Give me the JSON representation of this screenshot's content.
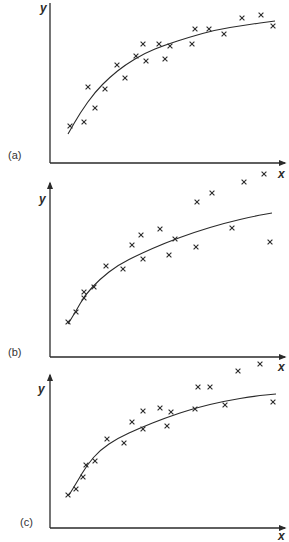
{
  "chart_data": [
    {
      "type": "scatter",
      "panel_label": "(a)",
      "xlabel": "x",
      "ylabel": "y",
      "grid": false,
      "axes": {
        "origin": [
          50,
          163
        ],
        "y_top": 3,
        "x_right": 285
      },
      "label_pos": {
        "panel": [
          8,
          159
        ],
        "y": [
          40,
          12
        ],
        "x": [
          278,
          178
        ]
      },
      "curve": [
        [
          68,
          134
        ],
        [
          80,
          113
        ],
        [
          95,
          92
        ],
        [
          110,
          77
        ],
        [
          125,
          65
        ],
        [
          145,
          53
        ],
        [
          165,
          45
        ],
        [
          190,
          37
        ],
        [
          215,
          30
        ],
        [
          245,
          25
        ],
        [
          275,
          21
        ]
      ],
      "points": [
        [
          70,
          126
        ],
        [
          84,
          122
        ],
        [
          88,
          87
        ],
        [
          95,
          108
        ],
        [
          105,
          89
        ],
        [
          117,
          65
        ],
        [
          125,
          78
        ],
        [
          136,
          56
        ],
        [
          143,
          44
        ],
        [
          146,
          61
        ],
        [
          159,
          44
        ],
        [
          165,
          59
        ],
        [
          170,
          46
        ],
        [
          192,
          44
        ],
        [
          195,
          29
        ],
        [
          209,
          29
        ],
        [
          224,
          34
        ],
        [
          242,
          18
        ],
        [
          261,
          15
        ],
        [
          273,
          26
        ]
      ]
    },
    {
      "type": "scatter",
      "panel_label": "(b)",
      "xlabel": "x",
      "ylabel": "y",
      "grid": false,
      "axes": {
        "origin": [
          50,
          357
        ],
        "y_top": 183,
        "x_right": 285
      },
      "label_pos": {
        "panel": [
          8,
          356
        ],
        "y": [
          39,
          203
        ],
        "x": [
          278,
          371
        ]
      },
      "curve": [
        [
          68,
          324
        ],
        [
          76,
          311
        ],
        [
          85,
          295
        ],
        [
          100,
          279
        ],
        [
          118,
          265
        ],
        [
          140,
          254
        ],
        [
          165,
          243
        ],
        [
          195,
          232
        ],
        [
          225,
          223
        ],
        [
          255,
          216
        ],
        [
          272,
          213
        ]
      ],
      "points": [
        [
          68,
          322
        ],
        [
          76,
          312
        ],
        [
          84,
          298
        ],
        [
          84,
          292
        ],
        [
          94,
          287
        ],
        [
          106,
          266
        ],
        [
          123,
          269
        ],
        [
          132,
          245
        ],
        [
          141,
          235
        ],
        [
          143,
          259
        ],
        [
          160,
          229
        ],
        [
          169,
          255
        ],
        [
          175,
          239
        ],
        [
          196,
          247
        ],
        [
          197,
          202
        ],
        [
          212,
          193
        ],
        [
          232,
          228
        ],
        [
          244,
          182
        ],
        [
          264,
          174
        ],
        [
          270,
          242
        ]
      ]
    },
    {
      "type": "scatter",
      "panel_label": "(c)",
      "xlabel": "x",
      "ylabel": "y",
      "grid": false,
      "axes": {
        "origin": [
          50,
          528
        ],
        "y_top": 375,
        "x_right": 285
      },
      "label_pos": {
        "panel": [
          20,
          526
        ],
        "y": [
          38,
          393
        ],
        "x": [
          278,
          540
        ]
      },
      "curve": [
        [
          69,
          495
        ],
        [
          77,
          482
        ],
        [
          87,
          465
        ],
        [
          100,
          450
        ],
        [
          118,
          438
        ],
        [
          140,
          428
        ],
        [
          165,
          418
        ],
        [
          195,
          408
        ],
        [
          225,
          401
        ],
        [
          255,
          396
        ],
        [
          276,
          394
        ]
      ],
      "points": [
        [
          68,
          495
        ],
        [
          76,
          489
        ],
        [
          83,
          477
        ],
        [
          86,
          465
        ],
        [
          95,
          461
        ],
        [
          107,
          439
        ],
        [
          124,
          443
        ],
        [
          132,
          422
        ],
        [
          143,
          411
        ],
        [
          143,
          429
        ],
        [
          160,
          408
        ],
        [
          167,
          426
        ],
        [
          171,
          412
        ],
        [
          195,
          409
        ],
        [
          198,
          387
        ],
        [
          210,
          387
        ],
        [
          225,
          405
        ],
        [
          238,
          371
        ],
        [
          260,
          364
        ],
        [
          273,
          402
        ]
      ]
    }
  ]
}
